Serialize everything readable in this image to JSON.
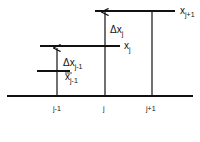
{
  "diagram": {
    "baseline_labels": [
      "j-1",
      "j",
      "j+1"
    ],
    "level_labels": {
      "x_j_plus_1": {
        "base": "x",
        "sub": "j+1"
      },
      "x_j": {
        "base": "x",
        "sub": "j"
      },
      "x_j_minus_1": {
        "base": "x",
        "sub": "j-1"
      }
    },
    "delta_labels": {
      "delta_x_j": {
        "base": "Δx",
        "sub": "j"
      },
      "delta_x_j_minus_1": {
        "base": "Δx",
        "sub": "j-1"
      }
    },
    "line_color": "#111111"
  }
}
